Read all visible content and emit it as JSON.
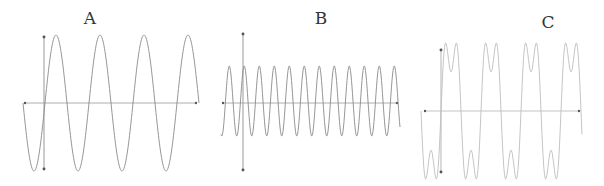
{
  "figure": {
    "panels": [
      {
        "id": "A",
        "label": "A",
        "label_pos": [
          90,
          10
        ],
        "stroke": "#8a8a8a",
        "axis_color": "#999999",
        "y_axis": {
          "x": 44,
          "top": 37,
          "bottom": 169
        },
        "x_axis": {
          "y": 103,
          "left": 25,
          "right": 196
        },
        "wave": {
          "type": "sine",
          "x_start": 23,
          "x_end": 199,
          "center_y": 103,
          "amplitude": 68,
          "period": 44,
          "phase_x": 45,
          "harmonic3": 0
        }
      },
      {
        "id": "B",
        "label": "B",
        "label_pos": [
          321,
          10
        ],
        "stroke": "#8a8a8a",
        "axis_color": "#999999",
        "y_axis": {
          "x": 243,
          "top": 34,
          "bottom": 170
        },
        "x_axis": {
          "y": 103,
          "left": 223,
          "right": 397
        },
        "wave": {
          "type": "sine",
          "x_start": 221,
          "x_end": 400,
          "center_y": 101,
          "amplitude": 35,
          "period": 15,
          "phase_x": 225.5,
          "harmonic3": 0
        }
      },
      {
        "id": "C",
        "label": "C",
        "label_pos": [
          548,
          14
        ],
        "stroke": "#bdbdbd",
        "axis_color": "#b5b5b5",
        "y_axis": {
          "x": 441,
          "top": 50,
          "bottom": 172
        },
        "x_axis": {
          "y": 111,
          "left": 425,
          "right": 579
        },
        "wave": {
          "type": "square-approx",
          "x_start": 421,
          "x_end": 582,
          "center_y": 111,
          "amplitude": 68,
          "period": 40,
          "phase_x": 441,
          "harmonic3": 0.42
        }
      }
    ]
  }
}
